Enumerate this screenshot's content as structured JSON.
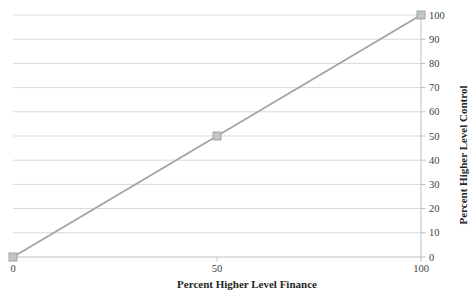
{
  "chart_data": {
    "type": "line",
    "x": [
      0,
      50,
      100
    ],
    "series": [
      {
        "values": [
          0,
          50,
          100
        ]
      }
    ],
    "xlabel": "Percent Higher Level Finance",
    "ylabel": "Percent Higher Level Control",
    "xlim": [
      0,
      100
    ],
    "ylim": [
      0,
      100
    ],
    "x_ticks": [
      0,
      50,
      100
    ],
    "y_ticks": [
      0,
      10,
      20,
      30,
      40,
      50,
      60,
      70,
      80,
      90,
      100
    ],
    "y_axis_side": "right",
    "grid": "horizontal",
    "legend": "none",
    "marker": "square",
    "colors": {
      "line": "#A5A5A5",
      "marker_fill": "#C4C4C4",
      "grid": "#D9D9D9",
      "axis": "#BFBFBF",
      "tick_text": "#404040",
      "title_text": "#262626",
      "background": "#FFFFFF"
    }
  }
}
